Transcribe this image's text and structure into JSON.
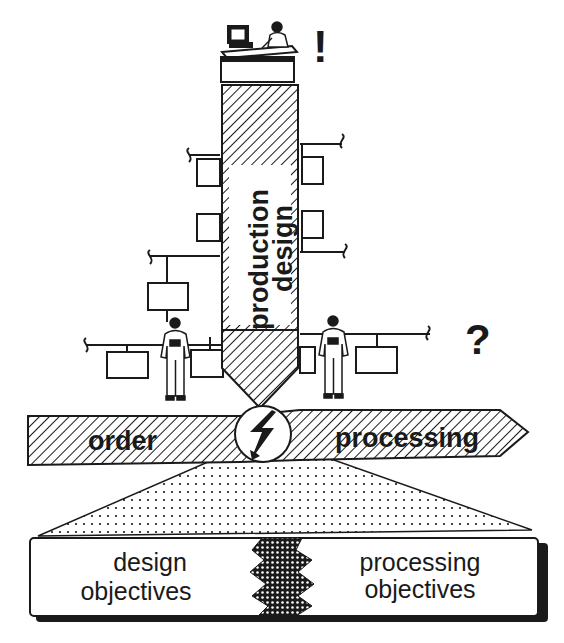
{
  "diagram": {
    "pencil_label_line1": "production",
    "pencil_label_line2": "design",
    "exclamation": "!",
    "question": "?",
    "arrow_left_label": "order",
    "arrow_right_label": "processing",
    "base_left_line1": "design",
    "base_left_line2": "objectives",
    "base_right_line1": "processing",
    "base_right_line2": "objectives",
    "icons": [
      "desk-with-computer-icon",
      "planner-person-icon",
      "worker-left-icon",
      "worker-right-icon",
      "lightning-conflict-icon"
    ],
    "colors": {
      "ink": "#1a1a1a",
      "paper": "#ffffff"
    }
  }
}
